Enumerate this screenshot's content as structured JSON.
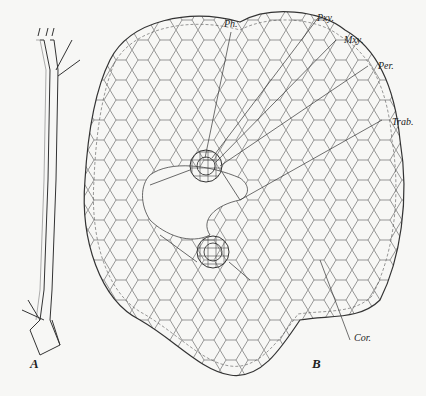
{
  "figure": {
    "panel_a_label": "A",
    "panel_b_label": "B",
    "labels": {
      "ph": "Ph.",
      "pxy": "Pxy.",
      "mxy": "Mxy.",
      "per": "Per.",
      "trab": "Trab.",
      "cor": "Cor."
    }
  }
}
